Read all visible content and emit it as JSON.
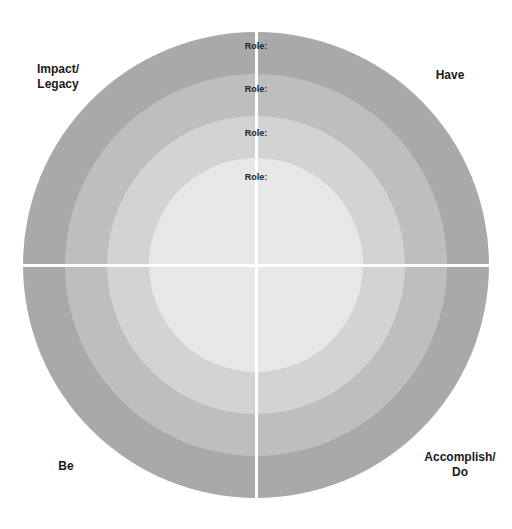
{
  "diagram": {
    "type": "concentric-quadrant-circle",
    "center": {
      "x": 256,
      "y": 265
    },
    "rings": [
      {
        "name": "outer",
        "radius": 233,
        "color": "#a9a9a9"
      },
      {
        "name": "second",
        "radius": 191,
        "color": "#bebebe"
      },
      {
        "name": "third",
        "radius": 149,
        "color": "#d3d3d3"
      },
      {
        "name": "inner",
        "radius": 107,
        "color": "#e7e7e7"
      }
    ],
    "role_labels": [
      "Role:",
      "Role:",
      "Role:",
      "Role:"
    ],
    "quadrants": {
      "top_left": {
        "line1": "Impact/",
        "line2": "Legacy"
      },
      "top_right": {
        "line1": "Have",
        "line2": ""
      },
      "bottom_left": {
        "line1": "Be",
        "line2": ""
      },
      "bottom_right": {
        "line1": "Accomplish/",
        "line2": "Do"
      }
    }
  }
}
